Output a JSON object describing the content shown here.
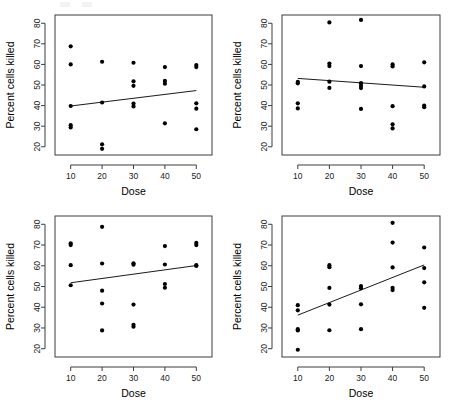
{
  "figure": {
    "layout": "2x2-grid",
    "background_color": "#ffffff",
    "point_color": "#000000",
    "line_color": "#1a1a1a",
    "frame_color": "#3c3c3c",
    "panel_count": 4
  },
  "axes_common": {
    "xlabel": "Dose",
    "ylabel": "Percent cells killed",
    "xticks": [
      "10",
      "20",
      "30",
      "40",
      "50"
    ],
    "yticks": [
      "20",
      "30",
      "40",
      "50",
      "60",
      "70",
      "80"
    ],
    "xlim": [
      5,
      55
    ],
    "ylim": [
      16,
      84
    ]
  },
  "chart_data": [
    {
      "type": "scatter",
      "panel": "top-left",
      "title": "",
      "xlabel": "Dose",
      "ylabel": "Percent cells killed",
      "xlim": [
        5,
        55
      ],
      "ylim": [
        16,
        84
      ],
      "xticks": [
        10,
        20,
        30,
        40,
        50
      ],
      "yticks": [
        20,
        30,
        40,
        50,
        60,
        70,
        80
      ],
      "grid": false,
      "legend": "none",
      "points": [
        {
          "x": 10,
          "y": 68.8
        },
        {
          "x": 10,
          "y": 60.0
        },
        {
          "x": 10,
          "y": 39.8
        },
        {
          "x": 10,
          "y": 30.5
        },
        {
          "x": 10,
          "y": 29.4
        },
        {
          "x": 20,
          "y": 61.3
        },
        {
          "x": 20,
          "y": 41.5
        },
        {
          "x": 20,
          "y": 21.2
        },
        {
          "x": 20,
          "y": 19.0
        },
        {
          "x": 30,
          "y": 60.8
        },
        {
          "x": 30,
          "y": 51.8
        },
        {
          "x": 30,
          "y": 49.6
        },
        {
          "x": 30,
          "y": 41.0
        },
        {
          "x": 30,
          "y": 39.6
        },
        {
          "x": 40,
          "y": 58.7
        },
        {
          "x": 40,
          "y": 52.0
        },
        {
          "x": 40,
          "y": 50.6
        },
        {
          "x": 40,
          "y": 31.4
        },
        {
          "x": 50,
          "y": 59.7
        },
        {
          "x": 50,
          "y": 58.7
        },
        {
          "x": 50,
          "y": 41.1
        },
        {
          "x": 50,
          "y": 38.5
        },
        {
          "x": 50,
          "y": 28.5
        }
      ],
      "fit_line": {
        "x1": 10,
        "y1": 39.8,
        "x2": 50,
        "y2": 47.3,
        "slope": 0.1875,
        "intercept": 37.93
      }
    },
    {
      "type": "scatter",
      "panel": "top-right",
      "title": "",
      "xlabel": "Dose",
      "ylabel": "Percent cells killed",
      "xlim": [
        5,
        55
      ],
      "ylim": [
        16,
        84
      ],
      "xticks": [
        10,
        20,
        30,
        40,
        50
      ],
      "yticks": [
        20,
        30,
        40,
        50,
        60,
        70,
        80
      ],
      "grid": false,
      "legend": "none",
      "points": [
        {
          "x": 10,
          "y": 51.5
        },
        {
          "x": 10,
          "y": 50.8
        },
        {
          "x": 10,
          "y": 41.1
        },
        {
          "x": 10,
          "y": 38.6
        },
        {
          "x": 20,
          "y": 80.4
        },
        {
          "x": 20,
          "y": 60.4
        },
        {
          "x": 20,
          "y": 59.2
        },
        {
          "x": 20,
          "y": 51.6
        },
        {
          "x": 20,
          "y": 48.6
        },
        {
          "x": 30,
          "y": 81.6
        },
        {
          "x": 30,
          "y": 59.2
        },
        {
          "x": 30,
          "y": 50.9
        },
        {
          "x": 30,
          "y": 49.6
        },
        {
          "x": 30,
          "y": 48.5
        },
        {
          "x": 30,
          "y": 38.4
        },
        {
          "x": 40,
          "y": 60.0
        },
        {
          "x": 40,
          "y": 59.0
        },
        {
          "x": 40,
          "y": 39.7
        },
        {
          "x": 40,
          "y": 30.9
        },
        {
          "x": 40,
          "y": 28.9
        },
        {
          "x": 50,
          "y": 61.0
        },
        {
          "x": 50,
          "y": 49.3
        },
        {
          "x": 50,
          "y": 40.0
        },
        {
          "x": 50,
          "y": 39.2
        }
      ],
      "fit_line": {
        "x1": 10,
        "y1": 53.2,
        "x2": 50,
        "y2": 48.9,
        "slope": -0.1075,
        "intercept": 54.28
      }
    },
    {
      "type": "scatter",
      "panel": "bottom-left",
      "title": "",
      "xlabel": "Dose",
      "ylabel": "Percent cells killed",
      "xlim": [
        5,
        55
      ],
      "ylim": [
        16,
        84
      ],
      "xticks": [
        10,
        20,
        30,
        40,
        50
      ],
      "yticks": [
        20,
        30,
        40,
        50,
        60,
        70,
        80
      ],
      "grid": false,
      "legend": "none",
      "points": [
        {
          "x": 10,
          "y": 70.8
        },
        {
          "x": 10,
          "y": 70.0
        },
        {
          "x": 10,
          "y": 60.3
        },
        {
          "x": 10,
          "y": 50.6
        },
        {
          "x": 20,
          "y": 78.8
        },
        {
          "x": 20,
          "y": 61.1
        },
        {
          "x": 20,
          "y": 48.0
        },
        {
          "x": 20,
          "y": 41.8
        },
        {
          "x": 20,
          "y": 28.8
        },
        {
          "x": 30,
          "y": 61.2
        },
        {
          "x": 30,
          "y": 60.5
        },
        {
          "x": 30,
          "y": 41.3
        },
        {
          "x": 30,
          "y": 31.5
        },
        {
          "x": 30,
          "y": 30.6
        },
        {
          "x": 40,
          "y": 69.5
        },
        {
          "x": 40,
          "y": 60.6
        },
        {
          "x": 40,
          "y": 51.2
        },
        {
          "x": 40,
          "y": 49.4
        },
        {
          "x": 50,
          "y": 71.0
        },
        {
          "x": 50,
          "y": 70.0
        },
        {
          "x": 50,
          "y": 60.3
        },
        {
          "x": 50,
          "y": 59.9
        }
      ],
      "fit_line": {
        "x1": 10,
        "y1": 51.8,
        "x2": 50,
        "y2": 60.1,
        "slope": 0.2075,
        "intercept": 49.73
      }
    },
    {
      "type": "scatter",
      "panel": "bottom-right",
      "title": "",
      "xlabel": "Dose",
      "ylabel": "Percent cells killed",
      "xlim": [
        5,
        55
      ],
      "ylim": [
        16,
        84
      ],
      "xticks": [
        10,
        20,
        30,
        40,
        50
      ],
      "yticks": [
        20,
        30,
        40,
        50,
        60,
        70,
        80
      ],
      "grid": false,
      "legend": "none",
      "points": [
        {
          "x": 10,
          "y": 41.0
        },
        {
          "x": 10,
          "y": 38.5
        },
        {
          "x": 10,
          "y": 29.4
        },
        {
          "x": 10,
          "y": 28.8
        },
        {
          "x": 10,
          "y": 19.5
        },
        {
          "x": 20,
          "y": 60.3
        },
        {
          "x": 20,
          "y": 59.3
        },
        {
          "x": 20,
          "y": 49.3
        },
        {
          "x": 20,
          "y": 41.3
        },
        {
          "x": 20,
          "y": 28.9
        },
        {
          "x": 30,
          "y": 50.2
        },
        {
          "x": 30,
          "y": 49.2
        },
        {
          "x": 30,
          "y": 41.4
        },
        {
          "x": 30,
          "y": 29.4
        },
        {
          "x": 40,
          "y": 80.7
        },
        {
          "x": 40,
          "y": 71.2
        },
        {
          "x": 40,
          "y": 59.2
        },
        {
          "x": 40,
          "y": 49.4
        },
        {
          "x": 40,
          "y": 48.3
        },
        {
          "x": 50,
          "y": 68.8
        },
        {
          "x": 50,
          "y": 58.9
        },
        {
          "x": 50,
          "y": 52.0
        },
        {
          "x": 50,
          "y": 39.7
        }
      ],
      "fit_line": {
        "x1": 10,
        "y1": 36.2,
        "x2": 50,
        "y2": 60.4,
        "slope": 0.605,
        "intercept": 30.15
      }
    }
  ]
}
